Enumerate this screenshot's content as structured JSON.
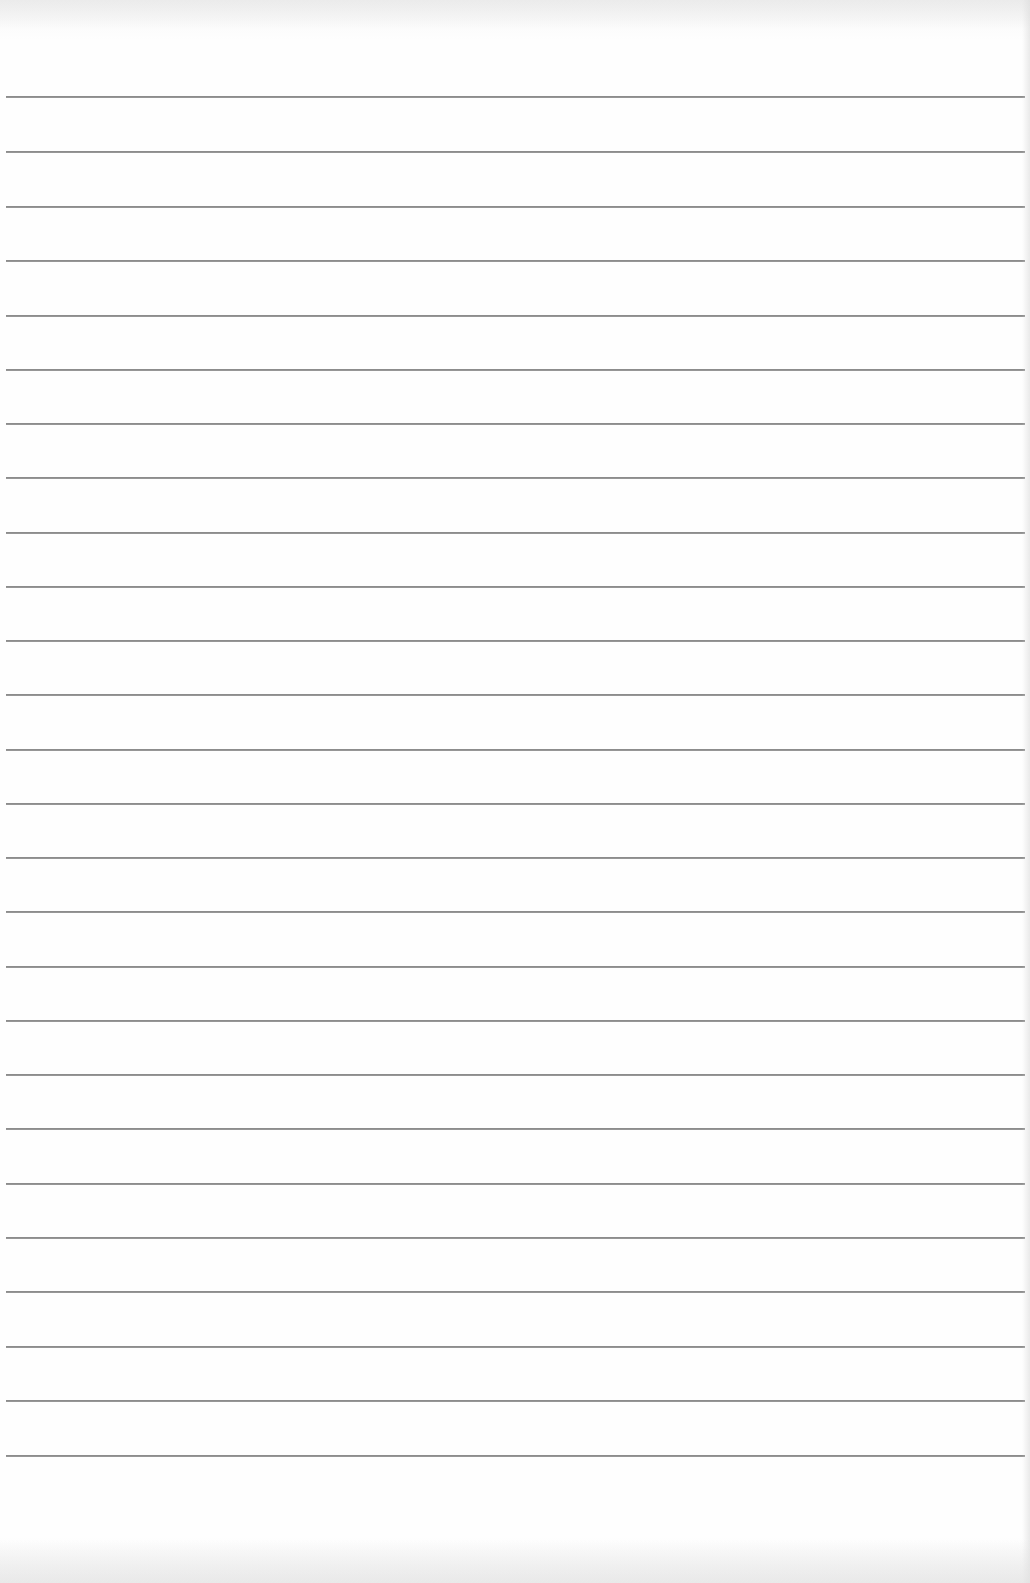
{
  "document": {
    "type": "lined-paper",
    "background_color": "#fdfdfd",
    "rule_color": "#8c8c8c",
    "rule_count": 26,
    "rules_y": [
      96,
      151,
      206,
      260,
      315,
      369,
      423,
      477,
      532,
      586,
      640,
      694,
      749,
      803,
      857,
      911,
      966,
      1020,
      1074,
      1128,
      1183,
      1237,
      1291,
      1346,
      1400,
      1455
    ]
  }
}
